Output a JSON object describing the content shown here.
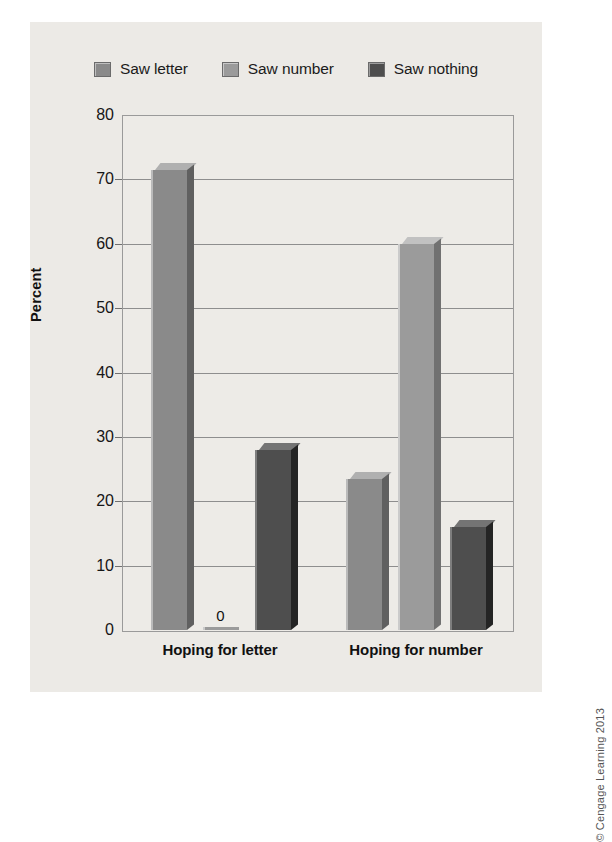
{
  "chart_data": {
    "type": "bar",
    "title": "",
    "subtitle": "",
    "xlabel": "",
    "ylabel": "Percent",
    "ylim": [
      0,
      80
    ],
    "ytick_step": 10,
    "yticks": [
      "80",
      "70",
      "60",
      "50",
      "40",
      "30",
      "20",
      "10",
      "0"
    ],
    "categories": [
      "Hoping for letter",
      "Hoping for number"
    ],
    "grid": true,
    "legend_position": "top-center",
    "series": [
      {
        "name": "Saw letter",
        "color": "#8a8a8a",
        "values": [
          71.5,
          23.5
        ],
        "data_labels": [
          "",
          ""
        ]
      },
      {
        "name": "Saw number",
        "color": "#9b9b9b",
        "values": [
          0,
          60
        ],
        "data_labels": [
          "0",
          ""
        ]
      },
      {
        "name": "Saw nothing",
        "color": "#4e4e4e",
        "values": [
          28,
          16
        ],
        "data_labels": [
          "",
          ""
        ]
      }
    ]
  },
  "legend": {
    "items": [
      {
        "label": "Saw letter",
        "color": "#8a8a8a"
      },
      {
        "label": "Saw number",
        "color": "#9b9b9b"
      },
      {
        "label": "Saw nothing",
        "color": "#4e4e4e"
      }
    ]
  },
  "axis": {
    "y_title": "Percent",
    "y_ticks": [
      "80",
      "70",
      "60",
      "50",
      "40",
      "30",
      "20",
      "10",
      "0"
    ],
    "x_categories": [
      "Hoping for letter",
      "Hoping for number"
    ]
  },
  "credit": {
    "text": "© Cengage Learning 2013"
  },
  "colors": {
    "figure_background": "#eceae6",
    "plot_background": "#edebe7",
    "gridline": "#8e8e8e",
    "frame": "#9a9a9a",
    "text": "#161616"
  }
}
